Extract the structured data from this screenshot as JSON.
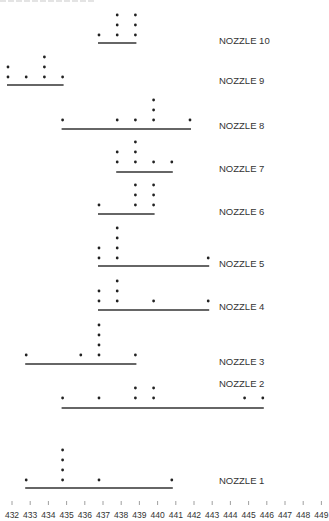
{
  "header": {
    "cut_title": ""
  },
  "chart_data": {
    "type": "scatter",
    "subtype": "dot-plot",
    "title": "",
    "xlabel": "",
    "ylabel": "",
    "xlim": [
      432,
      449
    ],
    "x_ticks": [
      432,
      433,
      434,
      435,
      436,
      437,
      438,
      439,
      440,
      441,
      442,
      443,
      444,
      445,
      446,
      447,
      448,
      449
    ],
    "grid": false,
    "legend": "none",
    "series": [
      {
        "name": "NOZZLE 10",
        "values": [
          437,
          438,
          438,
          438,
          439,
          439,
          439
        ],
        "range": [
          437,
          439
        ]
      },
      {
        "name": "NOZZLE 9",
        "values": [
          432,
          432,
          433,
          434,
          434,
          434,
          435
        ],
        "range": [
          432,
          435
        ]
      },
      {
        "name": "NOZZLE 8",
        "values": [
          435,
          438,
          439,
          440,
          440,
          440,
          442
        ],
        "range": [
          435,
          442
        ]
      },
      {
        "name": "NOZZLE 7",
        "values": [
          438,
          438,
          439,
          439,
          439,
          440,
          441
        ],
        "range": [
          438,
          441
        ]
      },
      {
        "name": "NOZZLE 6",
        "values": [
          437,
          439,
          439,
          439,
          440,
          440,
          440
        ],
        "range": [
          437,
          440
        ]
      },
      {
        "name": "NOZZLE 5",
        "values": [
          437,
          437,
          438,
          438,
          438,
          438,
          443
        ],
        "range": [
          437,
          443
        ]
      },
      {
        "name": "NOZZLE 4",
        "values": [
          437,
          437,
          438,
          438,
          438,
          440,
          443
        ],
        "range": [
          437,
          443
        ]
      },
      {
        "name": "NOZZLE 3",
        "values": [
          433,
          436,
          437,
          437,
          437,
          437,
          439
        ],
        "range": [
          433,
          439
        ]
      },
      {
        "name": "NOZZLE 2",
        "values": [
          435,
          437,
          439,
          439,
          440,
          440,
          445,
          446
        ],
        "range": [
          435,
          446
        ]
      },
      {
        "name": "NOZZLE 1",
        "values": [
          433,
          435,
          435,
          435,
          435,
          437,
          441
        ],
        "range": [
          433,
          441
        ]
      }
    ]
  },
  "layout": {
    "rows": [
      {
        "base": 35,
        "line": 43,
        "label_y": 44
      },
      {
        "base": 77,
        "line": 85,
        "label_y": 84
      },
      {
        "base": 120,
        "line": 129,
        "label_y": 129
      },
      {
        "base": 162,
        "line": 172,
        "label_y": 172
      },
      {
        "base": 205,
        "line": 214,
        "label_y": 215
      },
      {
        "base": 258,
        "line": 266,
        "label_y": 267
      },
      {
        "base": 301,
        "line": 310,
        "label_y": 310
      },
      {
        "base": 355,
        "line": 364,
        "label_y": 365
      },
      {
        "base": 398,
        "line": 408,
        "label_y": 387
      },
      {
        "base": 480,
        "line": 488,
        "label_y": 484
      }
    ],
    "colors": {
      "dot": "#222222",
      "line": "#333333",
      "text": "#333333"
    }
  }
}
